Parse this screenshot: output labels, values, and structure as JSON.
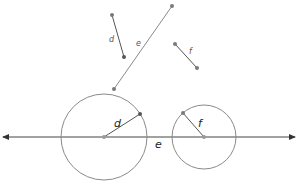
{
  "colors": {
    "line": "#8a8a8a",
    "dark_line": "#555555",
    "point": "#7a7a7a",
    "axis": "#444444",
    "background": "#ffffff"
  },
  "segments": {
    "d": {
      "label": "d",
      "x1": 112,
      "y1": 15,
      "x2": 124,
      "y2": 57,
      "label_x": 109,
      "label_y": 42
    },
    "e": {
      "label": "e",
      "x1": 172,
      "y1": 6,
      "x2": 114,
      "y2": 89,
      "label_x": 136,
      "label_y": 46
    },
    "f": {
      "label": "f",
      "x1": 175,
      "y1": 44,
      "x2": 197,
      "y2": 68,
      "label_x": 189,
      "label_y": 54
    }
  },
  "number_line": {
    "label": "e",
    "y": 137,
    "x_start": 3,
    "x_end": 295,
    "label_x": 155,
    "label_y": 148
  },
  "circles": [
    {
      "name": "circle-d",
      "cx": 104,
      "cy": 137,
      "r": 43,
      "radius_label": "d",
      "radius_end_x": 140,
      "radius_end_y": 114,
      "label_x": 114,
      "label_y": 127
    },
    {
      "name": "circle-f",
      "cx": 204,
      "cy": 137,
      "r": 32,
      "radius_label": "f",
      "radius_end_x": 183,
      "radius_end_y": 113,
      "label_x": 198,
      "label_y": 127
    }
  ]
}
